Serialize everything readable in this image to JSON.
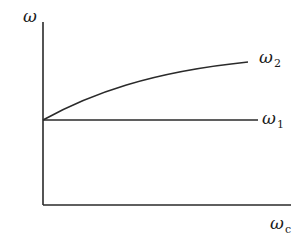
{
  "figure": {
    "y_axis_label": "ω",
    "x_axis_label": {
      "base": "ω",
      "subscript": "c"
    },
    "curves": [
      {
        "name": "omega-2-curve",
        "label": {
          "base": "ω",
          "subscript": "2"
        },
        "shape": "increasing concave curve"
      },
      {
        "name": "omega-1-line",
        "label": {
          "base": "ω",
          "subscript": "1"
        },
        "shape": "horizontal line"
      }
    ],
    "colors": {
      "line": "#2a2a2a",
      "text": "#1a1a1a",
      "background": "#ffffff"
    }
  }
}
